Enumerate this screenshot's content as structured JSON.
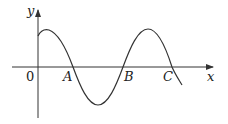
{
  "diagram": {
    "type": "sinusoidal-graph",
    "axes": {
      "x_label": "x",
      "y_label": "y",
      "origin_label": "0"
    },
    "points": [
      {
        "name": "A",
        "label": "A"
      },
      {
        "name": "B",
        "label": "B"
      },
      {
        "name": "C",
        "label": "C"
      }
    ],
    "colors": {
      "stroke": "#333333",
      "background": "#ffffff"
    }
  }
}
